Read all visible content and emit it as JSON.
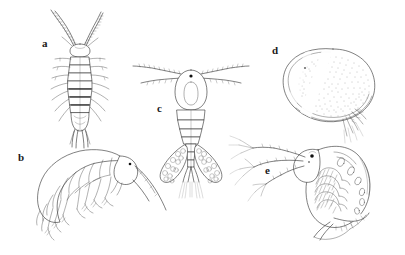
{
  "figure": {
    "background_color": "#ffffff",
    "ink_color": "#2b2b2b",
    "width": 405,
    "height": 255,
    "panel_count": 5
  },
  "labels": {
    "a": "a",
    "b": "b",
    "c": "c",
    "d": "d",
    "e": "e"
  },
  "panels": [
    {
      "key": "a",
      "label": "a",
      "name": "isopod-dorsal-view",
      "label_x": 42,
      "label_y": 38
    },
    {
      "key": "b",
      "label": "b",
      "name": "amphipod-lateral-view",
      "label_x": 18,
      "label_y": 152
    },
    {
      "key": "c",
      "label": "c",
      "name": "copepod-with-egg-sacs",
      "label_x": 157,
      "label_y": 103
    },
    {
      "key": "d",
      "label": "d",
      "name": "ostracod-lateral-view",
      "label_x": 272,
      "label_y": 45
    },
    {
      "key": "e",
      "label": "e",
      "name": "cladoceran-lateral-view",
      "label_x": 265,
      "label_y": 165
    }
  ]
}
